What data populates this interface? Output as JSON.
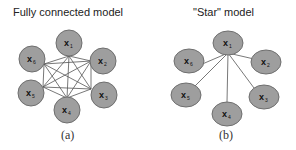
{
  "panels": [
    {
      "id": "a",
      "title": "Fully connected model",
      "caption": "(a)",
      "type": "fully-connected",
      "nodes": [
        {
          "label": "x",
          "sub": "1"
        },
        {
          "label": "x",
          "sub": "2"
        },
        {
          "label": "x",
          "sub": "3"
        },
        {
          "label": "x",
          "sub": "4"
        },
        {
          "label": "x",
          "sub": "5"
        },
        {
          "label": "x",
          "sub": "6"
        }
      ]
    },
    {
      "id": "b",
      "title": "\"Star\" model",
      "caption": "(b)",
      "type": "star",
      "hub": "x1",
      "nodes": [
        {
          "label": "x",
          "sub": "1"
        },
        {
          "label": "x",
          "sub": "2"
        },
        {
          "label": "x",
          "sub": "3"
        },
        {
          "label": "x",
          "sub": "4"
        },
        {
          "label": "x",
          "sub": "5"
        },
        {
          "label": "x",
          "sub": "6"
        }
      ]
    }
  ],
  "colors": {
    "node_fill": "#9e9e9e",
    "node_stroke": "#6e6e6e",
    "edge": "#555555"
  }
}
